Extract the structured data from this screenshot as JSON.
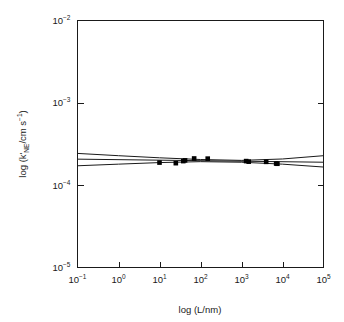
{
  "chart_data": {
    "type": "scatter",
    "title": "",
    "xlabel": "log (L/nm)",
    "ylabel": "log (k'NE/cm s-1)",
    "ylabel_parts": {
      "prefix": "log (",
      "symbol": "k'",
      "subscript": "NE",
      "mid": "/cm s",
      "superscript": "−1",
      "suffix": ")"
    },
    "xlabel_parts": {
      "text": "log (L/nm)"
    },
    "xscale": "log",
    "yscale": "log",
    "xlim": [
      0.1,
      100000
    ],
    "ylim": [
      1e-05,
      0.01
    ],
    "grid": false,
    "legend": null,
    "xticks": [
      {
        "value": 0.1,
        "mantissa": "10",
        "exponent": "-1",
        "label": "10-1"
      },
      {
        "value": 1,
        "mantissa": "10",
        "exponent": "0",
        "label": "100"
      },
      {
        "value": 10,
        "mantissa": "10",
        "exponent": "1",
        "label": "101"
      },
      {
        "value": 100,
        "mantissa": "10",
        "exponent": "2",
        "label": "102"
      },
      {
        "value": 1000,
        "mantissa": "10",
        "exponent": "3",
        "label": "103"
      },
      {
        "value": 10000,
        "mantissa": "10",
        "exponent": "4",
        "label": "104"
      },
      {
        "value": 100000,
        "mantissa": "10",
        "exponent": "5",
        "label": "105"
      }
    ],
    "yticks": [
      {
        "value": 0.01,
        "mantissa": "10",
        "exponent": "-2",
        "label": "10-2"
      },
      {
        "value": 0.001,
        "mantissa": "10",
        "exponent": "-3",
        "label": "10-3"
      },
      {
        "value": 0.0001,
        "mantissa": "10",
        "exponent": "-4",
        "label": "10-4"
      },
      {
        "value": 1e-05,
        "mantissa": "10",
        "exponent": "-5",
        "label": "10-5"
      }
    ],
    "series": [
      {
        "name": "measured rate constants",
        "marker": "filled-square",
        "marker_color": "#000000",
        "points": [
          {
            "x": 10.0,
            "y": 0.000188
          },
          {
            "x": 25.0,
            "y": 0.000185
          },
          {
            "x": 38.0,
            "y": 0.000196
          },
          {
            "x": 42.0,
            "y": 0.0002
          },
          {
            "x": 70.0,
            "y": 0.000211
          },
          {
            "x": 150.0,
            "y": 0.00021
          },
          {
            "x": 1300.0,
            "y": 0.000196
          },
          {
            "x": 1500.0,
            "y": 0.000193
          },
          {
            "x": 4000.0,
            "y": 0.000192
          },
          {
            "x": 7000.0,
            "y": 0.000183
          },
          {
            "x": 7500.0,
            "y": 0.000182
          }
        ]
      }
    ],
    "fit_line": {
      "name": "linear regression fit",
      "color": "#1a1a1a",
      "endpoints": [
        {
          "x": 0.1,
          "y": 0.000207
        },
        {
          "x": 100000.0,
          "y": 0.00019
        }
      ]
    },
    "confidence_bands": {
      "name": "confidence interval band",
      "color": "#1a1a1a",
      "upper": [
        {
          "x": 0.1,
          "y": 0.000243
        },
        {
          "x": 1.0,
          "y": 0.000228
        },
        {
          "x": 10.0,
          "y": 0.000215
        },
        {
          "x": 100.0,
          "y": 0.000205
        },
        {
          "x": 1000.0,
          "y": 0.0002
        },
        {
          "x": 10000.0,
          "y": 0.000208
        },
        {
          "x": 100000.0,
          "y": 0.000228
        }
      ],
      "lower": [
        {
          "x": 0.1,
          "y": 0.000172
        },
        {
          "x": 1.0,
          "y": 0.00018
        },
        {
          "x": 10.0,
          "y": 0.000188
        },
        {
          "x": 100.0,
          "y": 0.000193
        },
        {
          "x": 1000.0,
          "y": 0.00019
        },
        {
          "x": 10000.0,
          "y": 0.00018
        },
        {
          "x": 100000.0,
          "y": 0.000166
        }
      ]
    }
  }
}
